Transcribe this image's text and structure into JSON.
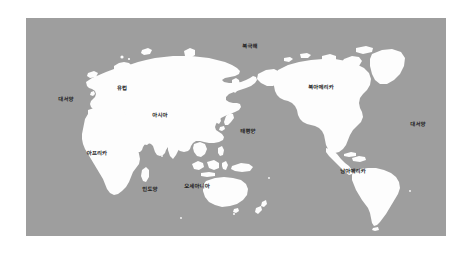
{
  "figure": {
    "kind": "world-map",
    "title_text": "",
    "ocean_color": "#9e9e9e",
    "land_color": "#fdfdfd",
    "label_color": "#1c1c1c",
    "page_background": "#ffffff",
    "projection_note": "pacific-centered world map"
  },
  "labels": [
    {
      "id": "arctic-ocean",
      "text": "북극해",
      "kind": "ocean",
      "x": 250,
      "y": 48
    },
    {
      "id": "europe",
      "text": "유럽",
      "kind": "continent",
      "x": 122,
      "y": 90
    },
    {
      "id": "north-america",
      "text": "북아메리카",
      "kind": "continent",
      "x": 321,
      "y": 89
    },
    {
      "id": "atlantic-west",
      "text": "대서양",
      "kind": "ocean",
      "x": 66,
      "y": 101
    },
    {
      "id": "asia",
      "text": "아시아",
      "kind": "continent",
      "x": 160,
      "y": 117
    },
    {
      "id": "pacific-ocean",
      "text": "태평양",
      "kind": "ocean",
      "x": 248,
      "y": 133
    },
    {
      "id": "atlantic-east",
      "text": "대서양",
      "kind": "ocean",
      "x": 418,
      "y": 126
    },
    {
      "id": "africa",
      "text": "아프리카",
      "kind": "continent",
      "x": 97,
      "y": 155
    },
    {
      "id": "south-america",
      "text": "남아메리카",
      "kind": "continent",
      "x": 353,
      "y": 173
    },
    {
      "id": "indian-ocean",
      "text": "인도양",
      "kind": "ocean",
      "x": 150,
      "y": 191
    },
    {
      "id": "oceania",
      "text": "오세아니아",
      "kind": "continent",
      "x": 197,
      "y": 188
    }
  ]
}
